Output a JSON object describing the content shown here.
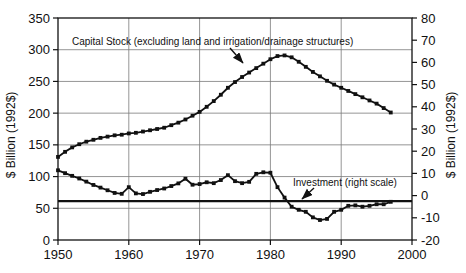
{
  "chart_data": {
    "type": "line",
    "title": "",
    "years": [
      1950,
      1951,
      1952,
      1953,
      1954,
      1955,
      1956,
      1957,
      1958,
      1959,
      1960,
      1961,
      1962,
      1963,
      1964,
      1965,
      1966,
      1967,
      1968,
      1969,
      1970,
      1971,
      1972,
      1973,
      1974,
      1975,
      1976,
      1977,
      1978,
      1979,
      1980,
      1981,
      1982,
      1983,
      1984,
      1985,
      1986,
      1987,
      1988,
      1989,
      1990,
      1991,
      1992,
      1993,
      1994,
      1995,
      1996,
      1997
    ],
    "series": [
      {
        "name": "Capital Stock (excluding land and irrigation/drainage structures)",
        "axis": "left",
        "values": [
          131,
          139,
          146,
          151,
          155,
          158,
          161,
          163,
          165,
          166,
          168,
          169,
          171,
          173,
          175,
          177,
          181,
          185,
          190,
          196,
          202,
          210,
          219,
          229,
          240,
          249,
          257,
          264,
          271,
          278,
          285,
          290,
          291,
          288,
          281,
          273,
          265,
          258,
          251,
          245,
          240,
          235,
          230,
          225,
          220,
          215,
          208,
          201
        ]
      },
      {
        "name": "Investment (right scale)",
        "axis": "right",
        "values": [
          11.4,
          10.1,
          8.9,
          7.7,
          6.3,
          4.8,
          3.6,
          2.4,
          1.2,
          0.8,
          3.8,
          1.0,
          0.7,
          1.7,
          2.5,
          3.2,
          4.3,
          5.5,
          7.6,
          4.9,
          5.2,
          6.0,
          5.6,
          7.0,
          9.2,
          6.5,
          5.6,
          6.2,
          9.8,
          10.5,
          10.3,
          3.8,
          -0.9,
          -5.0,
          -6.4,
          -7.3,
          -9.8,
          -11.0,
          -10.5,
          -7.3,
          -6.4,
          -4.6,
          -4.4,
          -5.0,
          -4.6,
          -3.9,
          -3.9,
          -2.8
        ]
      }
    ],
    "left_axis": {
      "label": "$ Billion (1992$)",
      "min": 0,
      "max": 350,
      "ticks": [
        0,
        50,
        100,
        150,
        200,
        250,
        300,
        350
      ]
    },
    "right_axis": {
      "label": "$ Billion (1992$)",
      "min": -20,
      "max": 80,
      "ticks": [
        -20,
        -10,
        0,
        10,
        20,
        30,
        40,
        50,
        60,
        70,
        80
      ]
    },
    "x_axis": {
      "min": 1950,
      "max": 2000,
      "ticks": [
        1950,
        1960,
        1970,
        1980,
        1990,
        2000
      ]
    },
    "reference_line": {
      "axis": "right",
      "value": -2.5
    },
    "grid": true,
    "legend_position": "annotations-in-plot",
    "colors": {
      "series": "#111111",
      "grid": "#7a7a7a",
      "background": "#ffffff",
      "text": "#111111"
    }
  },
  "annotations": {
    "capital_label": "Capital Stock (excluding land and irrigation/drainage structures)",
    "investment_label": "Investment (right scale)"
  }
}
